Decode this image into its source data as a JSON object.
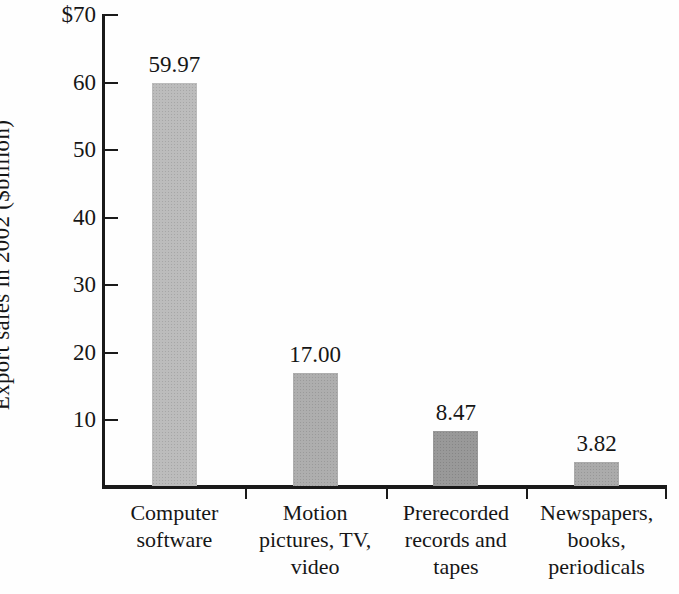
{
  "figure": {
    "background": "#fefefe",
    "axis_color": "#1a1a1a",
    "text_color": "#161616"
  },
  "chart_data": {
    "type": "bar",
    "title": "",
    "xlabel": "",
    "ylabel": "Export sales in 2002 ($billion)",
    "ylim": [
      0,
      70
    ],
    "grid": false,
    "legend": null,
    "ytick_values": [
      10,
      20,
      30,
      40,
      50,
      60,
      70
    ],
    "ytick_labels": [
      "10",
      "20",
      "30",
      "40",
      "50",
      "60",
      "$70"
    ],
    "categories": [
      "Computer software",
      "Motion pictures, TV, video",
      "Prerecorded records and tapes",
      "Newspapers, books, periodicals"
    ],
    "category_lines": [
      [
        "Computer",
        "software"
      ],
      [
        "Motion",
        "pictures, TV,",
        "video"
      ],
      [
        "Prerecorded",
        "records and",
        "tapes"
      ],
      [
        "Newspapers,",
        "books,",
        "periodicals"
      ]
    ],
    "values": [
      59.97,
      17.0,
      8.47,
      3.82
    ],
    "value_labels": [
      "59.97",
      "17.00",
      "8.47",
      "3.82"
    ],
    "bar_colors": [
      "#b9b9b9",
      "#ababab",
      "#959595",
      "#a8a8a8"
    ]
  }
}
